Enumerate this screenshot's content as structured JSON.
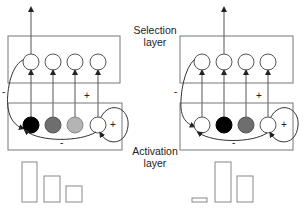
{
  "labels": {
    "selection_line1": "Selection",
    "selection_line2": "layer",
    "activation_line1": "Activation",
    "activation_line2": "layer"
  },
  "signs": {
    "left_minus_outer": "-",
    "left_plus_upper": "+",
    "left_minus_inner": "-",
    "left_plus_self": "+",
    "right_minus_outer": "-",
    "right_plus_upper": "+",
    "right_minus_inner": "-",
    "right_plus_self": "+"
  },
  "colors": {
    "line": "#555555",
    "box": "#777777",
    "unit_black": "#000000",
    "unit_dark_gray": "#6e6e6e",
    "unit_light_gray": "#b4b4b4",
    "unit_white": "#ffffff"
  },
  "panels": [
    {
      "name": "left",
      "selected_unit": 1,
      "activation_units": [
        "black",
        "dark-gray",
        "light-gray",
        "white"
      ],
      "bar_heights_relative": [
        40,
        26,
        16
      ]
    },
    {
      "name": "right",
      "selected_unit": 2,
      "activation_units": [
        "white",
        "black",
        "dark-gray",
        "white"
      ],
      "bar_heights_relative": [
        3,
        40,
        26
      ]
    }
  ]
}
